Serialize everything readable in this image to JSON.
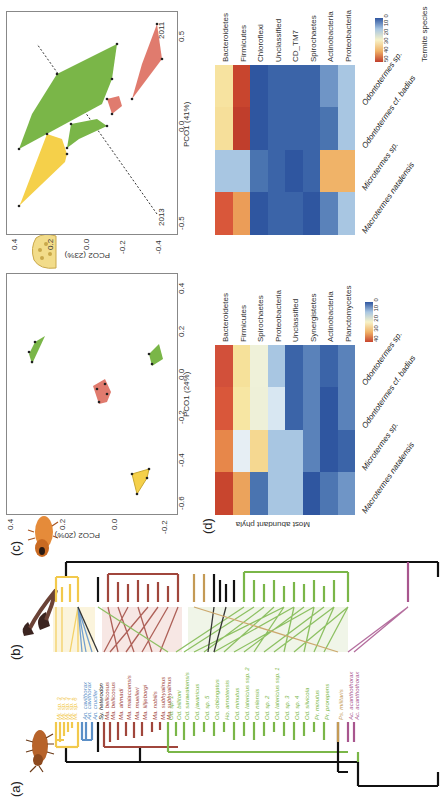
{
  "panels": {
    "a": "(a)",
    "b": "(b)",
    "c": "(c)",
    "d": "(d)"
  },
  "tree": {
    "species": [
      {
        "name": "Mi. sp. 3",
        "color": "#f2c94c"
      },
      {
        "name": "Mi. sp. 3",
        "color": "#f2c94c"
      },
      {
        "name": "Mi. sp. 3",
        "color": "#f2c94c"
      },
      {
        "name": "Mi. sp. 1",
        "color": "#f2c94c"
      },
      {
        "name": "Mi. sp. 6",
        "color": "#f2c94c"
      },
      {
        "name": "An. cavithorax",
        "color": "#5b8fc7"
      },
      {
        "name": "An. cavithorax",
        "color": "#5b8fc7"
      },
      {
        "name": "An. crucifer",
        "color": "#5b8fc7"
      },
      {
        "name": "Sy. heterodon",
        "color": "#111111"
      },
      {
        "name": "Ma. bellicosus",
        "color": "#a0463c"
      },
      {
        "name": "Ma. bellicosus",
        "color": "#a0463c"
      },
      {
        "name": "Ma. ahmadi",
        "color": "#a0463c"
      },
      {
        "name": "Ma. malaccensis",
        "color": "#a0463c"
      },
      {
        "name": "Ma. muelleri",
        "color": "#a0463c"
      },
      {
        "name": "Ma. lilljeborgi",
        "color": "#a0463c"
      },
      {
        "name": "Ma. nobilis",
        "color": "#a0463c"
      },
      {
        "name": "Ma. subhyalinus",
        "color": "#a0463c"
      },
      {
        "name": "Ma. subhyalinus",
        "color": "#a0463c"
      },
      {
        "name": "Od. sp. 1",
        "color": "#7ab648"
      },
      {
        "name": "Od. billitoni",
        "color": "#7ab648"
      },
      {
        "name": "Od. sarawakensis",
        "color": "#7ab648"
      },
      {
        "name": "Od. javanicus",
        "color": "#7ab648"
      },
      {
        "name": "Od. sp. 5",
        "color": "#7ab648"
      },
      {
        "name": "Od. oblongatus",
        "color": "#7ab648"
      },
      {
        "name": "Ho. annotensis",
        "color": "#7ab648"
      },
      {
        "name": "Od. minutus",
        "color": "#7ab648"
      },
      {
        "name": "Od. latericius ssp. 2",
        "color": "#7ab648"
      },
      {
        "name": "Od. nilensis",
        "color": "#7ab648"
      },
      {
        "name": "Od. sp. 2",
        "color": "#7ab648"
      },
      {
        "name": "Od. latericius ssp. 1",
        "color": "#7ab648"
      },
      {
        "name": "Od. sp. 3",
        "color": "#7ab648"
      },
      {
        "name": "Od. sp. 4",
        "color": "#7ab648"
      },
      {
        "name": "Od. silvicola",
        "color": "#7ab648"
      },
      {
        "name": "Pr. minutus",
        "color": "#7ab648"
      },
      {
        "name": "Pr. prorepens",
        "color": "#7ab648"
      },
      {
        "name": "Ps. militaris",
        "color": "#c49a55"
      },
      {
        "name": "Ac. acanthothorax",
        "color": "#a8568e"
      },
      {
        "name": "Ac. acanthothorax",
        "color": "#a8568e"
      }
    ]
  },
  "pco_c1": {
    "ylabel": "PCO2 (20%)",
    "xlabel": "PCO1 (24%)",
    "yticks": [
      "0.4",
      "0.2",
      "0.0",
      "-0.2"
    ],
    "xticks": [
      "-0.6",
      "-0.4",
      "-0.2",
      "0.0",
      "0.2",
      "0.4"
    ]
  },
  "pco_c2": {
    "ylabel": "PCO2 (23%)",
    "xlabel": "PCO1 (41%)",
    "yticks": [
      "0.4",
      "0.2",
      "0.0",
      "-0.2",
      "-0.4"
    ],
    "xticks": [
      "-0.5",
      "0.0",
      "0.5"
    ],
    "year_left": "2013",
    "year_right": "2011"
  },
  "heat1": {
    "ylabel": "Most abundant phyla",
    "rows": [
      "Bacteroidetes",
      "Firmicutes",
      "Spirochaetes",
      "Proteobacteria",
      "Unclassified",
      "Synergistetes",
      "Actinobacteria",
      "Planctomycetes"
    ],
    "cols": [
      "Macrotermes natalensis",
      "Microtermes sp.",
      "Odontotermes cf. badius",
      "Odontotermes sp."
    ],
    "legend": [
      "40",
      "30",
      "20",
      "10",
      "0"
    ]
  },
  "heat2": {
    "xlabel": "Termite species",
    "rows": [
      "Bacteroidetes",
      "Firmicutes",
      "Chloroflexi",
      "Unclassified",
      "CD_TM7",
      "Spirochaetes",
      "Actinobacteria",
      "Proteobacteria"
    ],
    "cols": [
      "Macrotermes natalensis",
      "Microtermes sp.",
      "Odontotermes cf. badius",
      "Odontotermes sp."
    ],
    "legend": [
      "50",
      "40",
      "30",
      "20",
      "10",
      "0"
    ]
  },
  "chart_data": [
    {
      "type": "scatter",
      "title": "(c) PCO of termite gut communities",
      "xlabel": "PCO1 (24%)",
      "ylabel": "PCO2 (20%)",
      "xlim": [
        -0.6,
        0.4
      ],
      "ylim": [
        -0.3,
        0.4
      ],
      "series": [
        {
          "name": "Microtermes",
          "color": "#f5d04a",
          "points": [
            [
              -0.52,
              0.02
            ],
            [
              -0.47,
              -0.03
            ],
            [
              -0.45,
              -0.05
            ],
            [
              -0.43,
              -0.06
            ],
            [
              -0.46,
              -0.03
            ]
          ]
        },
        {
          "name": "Macrotermes",
          "color": "#e07b6e",
          "points": [
            [
              -0.02,
              0.0
            ],
            [
              0.02,
              0.02
            ],
            [
              0.04,
              -0.02
            ],
            [
              0.05,
              0.03
            ],
            [
              0.03,
              -0.03
            ],
            [
              0.06,
              0.01
            ]
          ]
        },
        {
          "name": "Odontotermes A",
          "color": "#7ab648",
          "points": [
            [
              0.17,
              0.28
            ],
            [
              0.18,
              0.17
            ],
            [
              0.19,
              0.14
            ],
            [
              0.2,
              0.13
            ]
          ]
        },
        {
          "name": "Odontotermes B",
          "color": "#7ab648",
          "points": [
            [
              0.21,
              -0.22
            ],
            [
              0.23,
              -0.2
            ],
            [
              0.25,
              -0.21
            ],
            [
              0.22,
              -0.24
            ]
          ]
        }
      ]
    },
    {
      "type": "scatter",
      "title": "(c) PCO 2011 vs 2013",
      "xlabel": "PCO1 (41%)",
      "ylabel": "PCO2 (23%)",
      "xlim": [
        -0.5,
        0.6
      ],
      "ylim": [
        -0.45,
        0.45
      ],
      "series": [
        {
          "name": "2013 Microtermes",
          "color": "#f5d04a",
          "points": [
            [
              -0.33,
              0.42
            ],
            [
              -0.31,
              0.41
            ],
            [
              -0.16,
              0.33
            ],
            [
              -0.12,
              0.3
            ],
            [
              -0.04,
              0.27
            ]
          ]
        },
        {
          "name": "2013 Odontotermes",
          "color": "#7ab648",
          "points": [
            [
              -0.26,
              0.22
            ],
            [
              -0.22,
              0.14
            ],
            [
              -0.18,
              0.01
            ],
            [
              -0.2,
              0.04
            ],
            [
              -0.24,
              0.06
            ]
          ]
        },
        {
          "name": "2013 Macrotermes",
          "color": "#e07b6e",
          "points": [
            [
              -0.2,
              -0.07
            ],
            [
              -0.23,
              -0.1
            ],
            [
              -0.22,
              -0.13
            ],
            [
              -0.22,
              -0.15
            ]
          ]
        },
        {
          "name": "2011 Odontotermes",
          "color": "#7ab648",
          "points": [
            [
              0.35,
              0.18
            ],
            [
              0.28,
              0.1
            ],
            [
              0.26,
              0.1
            ],
            [
              0.15,
              -0.1
            ],
            [
              -0.05,
              -0.05
            ],
            [
              -0.07,
              -0.1
            ],
            [
              -0.1,
              -0.2
            ]
          ]
        },
        {
          "name": "2011 Macrotermes",
          "color": "#e07b6e",
          "points": [
            [
              0.52,
              -0.15
            ],
            [
              0.16,
              -0.3
            ],
            [
              0.06,
              -0.28
            ],
            [
              0.54,
              -0.24
            ],
            [
              0.55,
              -0.24
            ]
          ]
        }
      ],
      "annotations": [
        "2013",
        "2011",
        "dashed separation line"
      ]
    },
    {
      "type": "heatmap",
      "title": "(d) Most abundant phyla (relative abundance %)",
      "rows": [
        "Bacteroidetes",
        "Firmicutes",
        "Spirochaetes",
        "Proteobacteria",
        "Unclassified",
        "Synergistetes",
        "Actinobacteria",
        "Planctomycetes"
      ],
      "cols": [
        "Macrotermes natalensis",
        "Microtermes sp.",
        "Odontotermes cf. badius",
        "Odontotermes sp."
      ],
      "values": [
        [
          40,
          33,
          37,
          40
        ],
        [
          28,
          14,
          20,
          20
        ],
        [
          5,
          20,
          15,
          15
        ],
        [
          10,
          10,
          13,
          10
        ],
        [
          10,
          10,
          3,
          3
        ],
        [
          2,
          6,
          5,
          5
        ],
        [
          5,
          2,
          2,
          3
        ],
        [
          7,
          3,
          6,
          6
        ]
      ],
      "colorbar": [
        0,
        40
      ]
    },
    {
      "type": "heatmap",
      "title": "(d) Most abundant phyla (second dataset)",
      "rows": [
        "Bacteroidetes",
        "Firmicutes",
        "Chloroflexi",
        "Unclassified",
        "CD_TM7",
        "Spirochaetes",
        "Actinobacteria",
        "Proteobacteria"
      ],
      "cols": [
        "Macrotermes natalensis",
        "Microtermes sp.",
        "Odontotermes cf. badius",
        "Odontotermes sp."
      ],
      "values": [
        [
          45,
          12,
          25,
          27
        ],
        [
          35,
          12,
          48,
          46
        ],
        [
          3,
          6,
          3,
          3
        ],
        [
          4,
          5,
          5,
          5
        ],
        [
          4,
          3,
          5,
          5
        ],
        [
          3,
          4,
          5,
          5
        ],
        [
          7,
          33,
          5,
          8
        ],
        [
          12,
          33,
          12,
          11
        ]
      ],
      "colorbar": [
        0,
        50
      ]
    }
  ]
}
